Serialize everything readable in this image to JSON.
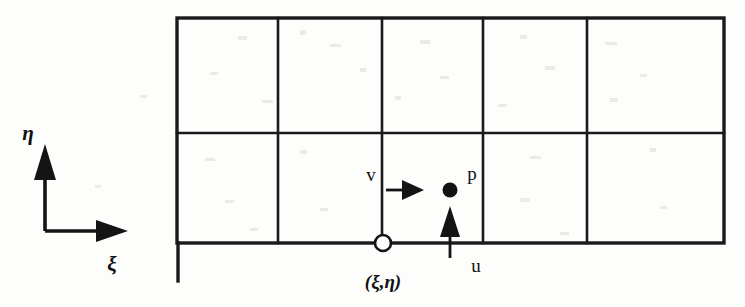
{
  "figure": {
    "type": "staggered-grid-diagram",
    "background_color": "#fdfdfc",
    "line_color": "#1a1a1a",
    "axes": {
      "origin": {
        "x": 45,
        "y": 231
      },
      "eta": {
        "label": "η",
        "name": "eta",
        "direction": "up",
        "tip": {
          "x": 45,
          "y": 147
        },
        "label_pos": {
          "x": 23,
          "y": 133
        }
      },
      "xi": {
        "label": "ξ",
        "name": "xi",
        "direction": "right",
        "tip": {
          "x": 127,
          "y": 231
        },
        "label_pos": {
          "x": 107,
          "y": 264
        }
      }
    },
    "grid": {
      "left": 177,
      "right": 724,
      "top": 18,
      "bottom": 243,
      "middle_y": 133,
      "columns": 5,
      "rows": 2,
      "vertical_dividers": [
        278,
        382,
        483,
        587
      ],
      "left_tail_bottom": 281
    },
    "annotations": [
      {
        "name": "pressure-node",
        "label": "p",
        "marker": "filled-circle",
        "marker_pos": {
          "x": 450,
          "y": 190
        },
        "marker_radius": 7,
        "label_pos": {
          "x": 471,
          "y": 174
        }
      },
      {
        "name": "corner-node",
        "label": "(ξ,η)",
        "marker": "open-circle",
        "marker_pos": {
          "x": 383,
          "y": 243
        },
        "marker_radius": 8,
        "label_pos": {
          "x": 383,
          "y": 283
        }
      },
      {
        "name": "v-velocity-arrow",
        "label": "v",
        "direction": "right",
        "shaft_from": {
          "x": 384,
          "y": 190
        },
        "shaft_to": {
          "x": 420,
          "y": 190
        },
        "label_pos": {
          "x": 370,
          "y": 176
        }
      },
      {
        "name": "u-velocity-arrow",
        "label": "u",
        "direction": "up",
        "shaft_from": {
          "x": 450,
          "y": 256
        },
        "shaft_to": {
          "x": 450,
          "y": 213
        },
        "label_pos": {
          "x": 473,
          "y": 265
        }
      }
    ]
  }
}
